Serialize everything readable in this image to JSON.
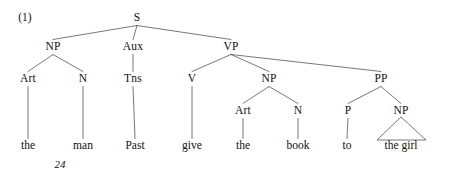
{
  "figure": {
    "example_number": "(1)",
    "page_number": "24",
    "type": "syntax-tree",
    "ink_color": "#111111",
    "line_color": "#555555",
    "background_color": "#ffffff"
  },
  "tree": {
    "nodes": [
      {
        "id": "S",
        "label": "S",
        "x": 137,
        "y": 18,
        "kind": "nonterminal"
      },
      {
        "id": "NP1",
        "label": "NP",
        "x": 53,
        "y": 47,
        "kind": "nonterminal"
      },
      {
        "id": "AUX",
        "label": "Aux",
        "x": 133,
        "y": 47,
        "kind": "nonterminal"
      },
      {
        "id": "VP",
        "label": "VP",
        "x": 231,
        "y": 47,
        "kind": "nonterminal"
      },
      {
        "id": "ART1",
        "label": "Art",
        "x": 28,
        "y": 79,
        "kind": "nonterminal"
      },
      {
        "id": "N1",
        "label": "N",
        "x": 83,
        "y": 79,
        "kind": "nonterminal"
      },
      {
        "id": "TNS",
        "label": "Tns",
        "x": 133,
        "y": 79,
        "kind": "nonterminal"
      },
      {
        "id": "V",
        "label": "V",
        "x": 192,
        "y": 79,
        "kind": "nonterminal"
      },
      {
        "id": "NP2",
        "label": "NP",
        "x": 269,
        "y": 79,
        "kind": "nonterminal"
      },
      {
        "id": "PP",
        "label": "PP",
        "x": 381,
        "y": 79,
        "kind": "nonterminal"
      },
      {
        "id": "ART2",
        "label": "Art",
        "x": 243,
        "y": 111,
        "kind": "nonterminal"
      },
      {
        "id": "N2",
        "label": "N",
        "x": 298,
        "y": 111,
        "kind": "nonterminal"
      },
      {
        "id": "P",
        "label": "P",
        "x": 348,
        "y": 111,
        "kind": "nonterminal"
      },
      {
        "id": "NP3",
        "label": "NP",
        "x": 401,
        "y": 111,
        "kind": "nonterminal"
      },
      {
        "id": "W_THE1",
        "label": "the",
        "x": 28,
        "y": 146,
        "kind": "terminal"
      },
      {
        "id": "W_MAN",
        "label": "man",
        "x": 83,
        "y": 146,
        "kind": "terminal"
      },
      {
        "id": "W_PAST",
        "label": "Past",
        "x": 135,
        "y": 146,
        "kind": "terminal"
      },
      {
        "id": "W_GIVE",
        "label": "give",
        "x": 192,
        "y": 146,
        "kind": "terminal"
      },
      {
        "id": "W_THE2",
        "label": "the",
        "x": 243,
        "y": 146,
        "kind": "terminal"
      },
      {
        "id": "W_BOOK",
        "label": "book",
        "x": 298,
        "y": 146,
        "kind": "terminal"
      },
      {
        "id": "W_TO",
        "label": "to",
        "x": 347,
        "y": 146,
        "kind": "terminal"
      },
      {
        "id": "W_GIRL",
        "label": "the girl",
        "x": 401,
        "y": 146,
        "kind": "terminal"
      }
    ],
    "edges": [
      {
        "from": "S",
        "to": "NP1"
      },
      {
        "from": "S",
        "to": "AUX"
      },
      {
        "from": "S",
        "to": "VP"
      },
      {
        "from": "NP1",
        "to": "ART1"
      },
      {
        "from": "NP1",
        "to": "N1"
      },
      {
        "from": "AUX",
        "to": "TNS"
      },
      {
        "from": "VP",
        "to": "V"
      },
      {
        "from": "VP",
        "to": "NP2"
      },
      {
        "from": "VP",
        "to": "PP"
      },
      {
        "from": "NP2",
        "to": "ART2"
      },
      {
        "from": "NP2",
        "to": "N2"
      },
      {
        "from": "PP",
        "to": "P"
      },
      {
        "from": "PP",
        "to": "NP3"
      },
      {
        "from": "ART1",
        "to": "W_THE1"
      },
      {
        "from": "N1",
        "to": "W_MAN"
      },
      {
        "from": "TNS",
        "to": "W_PAST"
      },
      {
        "from": "V",
        "to": "W_GIVE"
      },
      {
        "from": "ART2",
        "to": "W_THE2"
      },
      {
        "from": "N2",
        "to": "W_BOOK"
      },
      {
        "from": "P",
        "to": "W_TO"
      }
    ],
    "triangles": [
      {
        "from": "NP3",
        "span": "W_GIRL",
        "apex_x": 401,
        "apex_y": 117,
        "left_x": 377,
        "right_x": 426,
        "base_y": 140
      }
    ],
    "sentence": "the man Past give the book to the girl"
  },
  "layout": {
    "example_number_x": 25,
    "example_number_y": 18,
    "page_number_x": 60,
    "page_number_y": 164
  }
}
